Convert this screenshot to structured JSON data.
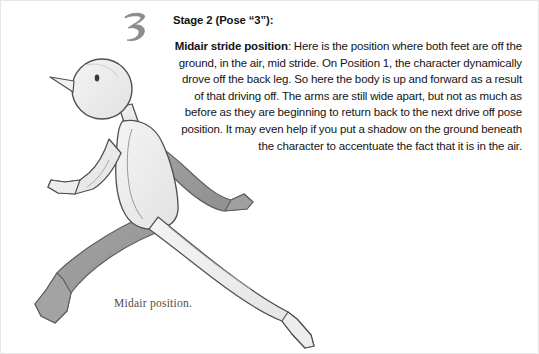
{
  "page": {
    "width": 539,
    "height": 354,
    "background": "#ffffff"
  },
  "stage_numeral": {
    "label": "3",
    "style": "hand-drawn",
    "color": "#8e8e8e"
  },
  "heading": {
    "text": "Stage 2 (Pose “3”):"
  },
  "body": {
    "lead": "Midair stride position",
    "rest": ": Here is the position where both feet are off the ground, in the air, mid stride. On Position 1, the character dynamically drove off the back leg. So here the body is up and forward as a result of that driving off. The arms are still wide apart, but not as much as before as they are beginning to return back to the next drive off pose position. It may even help if you put a shadow on the ground beneath the character to accentuate the fact that it is in the air.",
    "alignment": "right"
  },
  "caption": {
    "text": "Midair position."
  },
  "illustration": {
    "subject": "running-stick-figure-midair-stride",
    "parts": [
      "head",
      "nose",
      "eye",
      "neck",
      "torso",
      "front-arm",
      "rear-arm",
      "front-leg",
      "rear-leg",
      "front-foot",
      "rear-foot"
    ],
    "colors": {
      "fill_light": "#ececed",
      "fill_shadow": "#9b9b9b",
      "fill_mid": "#c9c9c9",
      "outline": "#4f4f4f",
      "outline_soft": "#7a7a7a"
    }
  }
}
